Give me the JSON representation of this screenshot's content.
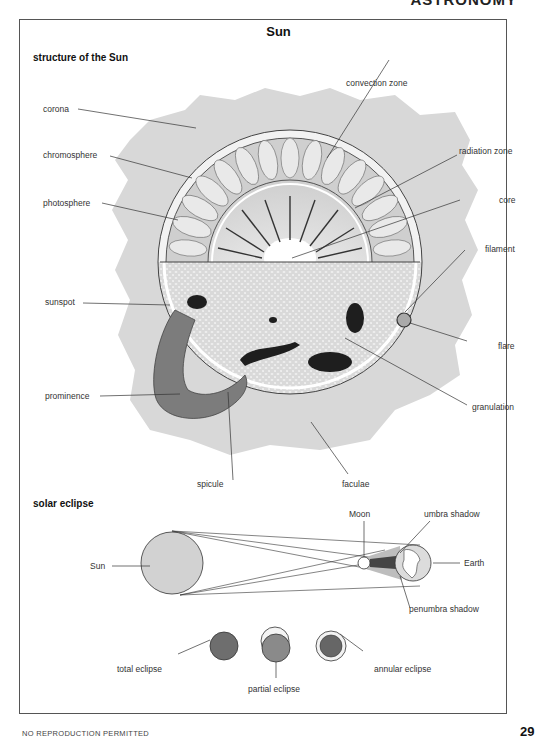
{
  "header": {
    "running_title": "ASTRONOMY"
  },
  "page": {
    "title": "Sun",
    "footer": "NO REPRODUCTION PERMITTED",
    "page_number": "29"
  },
  "structure": {
    "heading": "structure of the Sun",
    "labels": {
      "corona": "corona",
      "chromosphere": "chromosphere",
      "photosphere": "photosphere",
      "sunspot": "sunspot",
      "prominence": "prominence",
      "spicule": "spicule",
      "faculae": "faculae",
      "convection_zone": "convection zone",
      "radiation_zone": "radiation zone",
      "core": "core",
      "filament": "filament",
      "flare": "flare",
      "granulation": "granulation"
    }
  },
  "eclipse": {
    "heading": "solar eclipse",
    "labels": {
      "sun": "Sun",
      "moon": "Moon",
      "earth": "Earth",
      "umbra": "umbra shadow",
      "penumbra": "penumbra shadow",
      "total": "total eclipse",
      "partial": "partial eclipse",
      "annular": "annular eclipse"
    }
  },
  "colors": {
    "corona": "#d6d6d6",
    "sun_surface": "#e4e4e4",
    "prominence": "#7c7c7c",
    "eclipse_sun": "#d2d2d2",
    "eclipse_dark": "#6e6e6e",
    "line": "#333333"
  }
}
